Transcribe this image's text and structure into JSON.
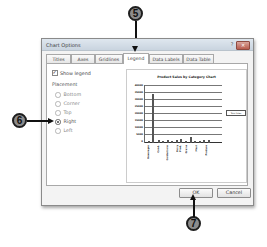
{
  "dialog": {
    "title": "Chart Options",
    "help_label": "?",
    "close_label": "✕"
  },
  "tabs": [
    {
      "label": "Titles",
      "active": false
    },
    {
      "label": "Axes",
      "active": false
    },
    {
      "label": "Gridlines",
      "active": false
    },
    {
      "label": "Legend",
      "active": true
    },
    {
      "label": "Data Labels",
      "active": false
    },
    {
      "label": "Data Table",
      "active": false
    }
  ],
  "legend_tab": {
    "show_legend_label": "Show legend",
    "show_legend_checked": true,
    "placement_label": "Placement",
    "placement_options": [
      {
        "label": "Bottom",
        "selected": false
      },
      {
        "label": "Corner",
        "selected": false
      },
      {
        "label": "Top",
        "selected": false
      },
      {
        "label": "Right",
        "selected": true
      },
      {
        "label": "Left",
        "selected": false
      }
    ]
  },
  "preview": {
    "chart_title": "Product Sales by Category Chart",
    "y_ticks": [
      "40000",
      "35000",
      "30000",
      "25000",
      "20000",
      "15000",
      "10000",
      "5000",
      "0"
    ],
    "legend_label": "Total Sales",
    "x_labels": [
      "Beverages",
      "Cond.",
      "Confections",
      "Dairy Prod.",
      "Grains",
      "Meat",
      "Produce"
    ]
  },
  "buttons": {
    "ok_label": "OK",
    "cancel_label": "Cancel"
  },
  "callouts": {
    "step5": "5",
    "step6": "6",
    "step7": "7"
  }
}
